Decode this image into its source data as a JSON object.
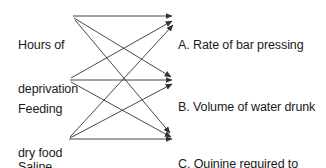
{
  "diagram": {
    "type": "bipartite-arrow-map",
    "background_color": "#ffffff",
    "line_color": "#333333",
    "text_color": "#1b1b1b",
    "sources": [
      {
        "id": "hours-of-deprivation",
        "line1": "Hours of",
        "line2": "deprivation",
        "origin": {
          "x": 73,
          "y": 16
        }
      },
      {
        "id": "feeding-dry-food",
        "line1": "Feeding",
        "line2": "dry food",
        "origin": {
          "x": 70,
          "y": 80
        }
      },
      {
        "id": "saline-injection",
        "line1": "Saline",
        "line2": "injection",
        "origin": {
          "x": 69,
          "y": 139
        }
      }
    ],
    "targets": [
      {
        "id": "rate-of-bar-pressing",
        "line1": "A. Rate of bar pressing",
        "line2": "",
        "anchor": {
          "x": 175,
          "y": 17
        }
      },
      {
        "id": "volume-of-water-drunk",
        "line1": "B. Volume of water drunk",
        "line2": "",
        "anchor": {
          "x": 175,
          "y": 80
        }
      },
      {
        "id": "quinine-required-to-stop-drinking",
        "line1": "C. Quinine required to",
        "line2": "stop drinking",
        "anchor": {
          "x": 174,
          "y": 138
        }
      }
    ],
    "edges": [
      {
        "from": "hours-of-deprivation",
        "to": "rate-of-bar-pressing"
      },
      {
        "from": "hours-of-deprivation",
        "to": "volume-of-water-drunk"
      },
      {
        "from": "hours-of-deprivation",
        "to": "quinine-required-to-stop-drinking"
      },
      {
        "from": "feeding-dry-food",
        "to": "rate-of-bar-pressing"
      },
      {
        "from": "feeding-dry-food",
        "to": "volume-of-water-drunk"
      },
      {
        "from": "feeding-dry-food",
        "to": "quinine-required-to-stop-drinking"
      },
      {
        "from": "saline-injection",
        "to": "rate-of-bar-pressing"
      },
      {
        "from": "saline-injection",
        "to": "volume-of-water-drunk"
      },
      {
        "from": "saline-injection",
        "to": "quinine-required-to-stop-drinking"
      }
    ]
  }
}
